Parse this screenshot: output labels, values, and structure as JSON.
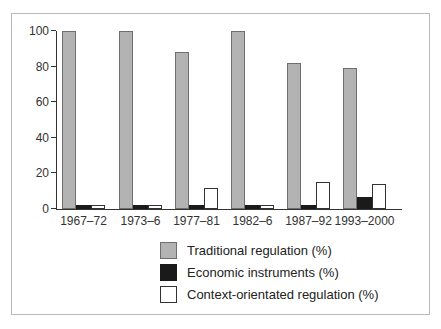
{
  "chart_data": {
    "type": "bar",
    "title": "",
    "xlabel": "",
    "ylabel": "",
    "categories": [
      "1967–72",
      "1973–6",
      "1977–81",
      "1982–6",
      "1987–92",
      "1993–2000"
    ],
    "series": [
      {
        "name": "Traditional regulation (%)",
        "key": "traditional-regulation",
        "values": [
          100,
          100,
          88,
          100,
          82,
          79
        ],
        "fill": "#b3b3b3",
        "border": "#6e6e6e"
      },
      {
        "name": "Economic instruments (%)",
        "key": "economic-instruments",
        "values": [
          2,
          2,
          2,
          2,
          2,
          7
        ],
        "fill": "#1a1a1a",
        "border": "#1a1a1a"
      },
      {
        "name": "Context-orientated regulation (%)",
        "key": "context-orientated-regulation",
        "values": [
          2,
          2,
          12,
          2,
          15,
          14
        ],
        "fill": "#ffffff",
        "border": "#333333"
      }
    ],
    "ylim": [
      0,
      100
    ],
    "yticks": [
      0,
      20,
      40,
      60,
      80,
      100
    ],
    "grid": false,
    "legend_position": "bottom",
    "axis_color": "#333333",
    "frame_border_color": "#b9b9b9"
  }
}
